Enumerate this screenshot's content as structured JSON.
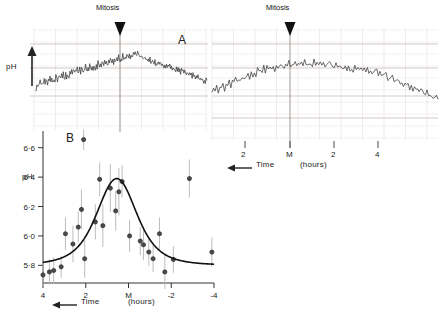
{
  "figure": {
    "title_a": "A",
    "title_b": "B",
    "mitosis_label_left": "Mitosis",
    "mitosis_label_right": "Mitosis",
    "ph_label_a": "pH",
    "ph_label_b": "pH",
    "time_label_a": "Time",
    "time_label_b": "Time",
    "hours_label_a": "(hours)",
    "hours_label_b": "(hours)",
    "ink_color": "#222222",
    "trace_color": "#3a3a3a",
    "grid_color": "#d8cfc8",
    "errorbar_color": "#b5b5b5"
  },
  "chart_data": [
    {
      "type": "line",
      "panel": "A",
      "title": "A",
      "description": "Continuous chart-recorder trace of intracellular pH through two successive mitoses",
      "ylabel": "pH",
      "xlabel": "Time",
      "xunits": "(hours)",
      "x_direction": "right-to-left",
      "annotations": [
        {
          "text": "Mitosis",
          "x_px": 120,
          "kind": "arrow-down"
        },
        {
          "text": "Mitosis",
          "x_px": 290,
          "kind": "arrow-down"
        }
      ],
      "grid": true,
      "axes": [
        {
          "id": "left-trace",
          "ticks": [],
          "tick_labels": []
        },
        {
          "id": "right-trace",
          "ticks": [
            245,
            290,
            334,
            378
          ],
          "tick_labels": [
            "2",
            "M",
            "2",
            "4"
          ]
        }
      ],
      "series": [
        {
          "name": "left-record",
          "values": [
            38,
            44,
            41,
            48,
            43,
            50,
            46,
            43,
            49,
            45,
            52,
            48,
            55,
            50,
            46,
            53,
            49,
            56,
            52,
            58,
            54,
            50,
            57,
            53,
            60,
            56,
            52,
            59,
            62,
            57,
            54,
            61,
            58,
            64,
            60,
            56,
            63,
            59,
            66,
            62,
            58,
            65,
            61,
            68,
            64,
            70,
            66,
            62,
            69,
            65,
            72,
            68,
            64,
            71,
            67,
            74,
            70,
            66,
            73,
            69,
            76,
            72,
            68,
            75,
            71,
            78,
            74,
            70,
            77,
            73,
            80,
            76,
            72,
            79,
            75,
            82,
            78,
            74,
            81,
            77,
            84,
            80,
            76,
            83,
            79,
            86,
            82,
            78,
            85,
            81,
            88,
            84,
            80,
            87,
            83,
            90,
            86,
            82,
            89,
            85,
            92,
            88,
            84,
            91,
            87,
            94,
            90,
            86,
            93,
            89,
            96,
            92,
            88,
            95,
            91,
            98,
            94,
            90,
            97,
            93,
            100,
            96,
            92,
            99,
            95,
            98,
            94,
            90,
            93,
            89,
            92,
            88,
            91,
            87,
            90,
            86,
            89,
            85,
            88,
            84,
            87,
            83,
            86,
            82,
            85,
            81,
            84,
            80,
            83,
            79,
            82,
            78,
            81,
            77,
            80,
            76,
            79,
            75,
            78,
            74,
            77,
            73,
            76,
            72,
            75,
            71,
            74,
            70,
            73,
            69,
            72,
            68,
            71,
            67,
            70,
            66,
            69,
            65,
            68,
            64,
            67,
            63,
            66,
            62,
            65,
            61,
            64,
            60,
            63,
            59,
            62,
            58,
            61,
            57,
            60,
            56,
            59,
            55,
            58,
            54,
            57,
            53,
            56,
            52,
            55,
            51,
            54,
            50
          ]
        },
        {
          "name": "right-record",
          "values": [
            44,
            50,
            46,
            53,
            48,
            55,
            50,
            57,
            52,
            59,
            54,
            61,
            56,
            63,
            58,
            65,
            60,
            67,
            62,
            69,
            64,
            71,
            66,
            73,
            68,
            75,
            70,
            77,
            72,
            79,
            74,
            81,
            76,
            83,
            78,
            85,
            80,
            87,
            82,
            84,
            80,
            86,
            82,
            88,
            84,
            86,
            82,
            88,
            84,
            90,
            86,
            88,
            84,
            90,
            86,
            92,
            88,
            90,
            86,
            92,
            88,
            90,
            86,
            92,
            88,
            94,
            90,
            92,
            88,
            90,
            86,
            88,
            84,
            90,
            86,
            88,
            84,
            86,
            82,
            88,
            84,
            86,
            82,
            84,
            80,
            86,
            82,
            84,
            80,
            82,
            78,
            84,
            80,
            82,
            78,
            80,
            76,
            82,
            78,
            80,
            76,
            78,
            74,
            80,
            76,
            78,
            74,
            76,
            72,
            74,
            70,
            72,
            68,
            70,
            66,
            68,
            64,
            66,
            62,
            64,
            60,
            62,
            58,
            60,
            56,
            58,
            54,
            56,
            52,
            54,
            50,
            52,
            48,
            50,
            46,
            48,
            44,
            46,
            42,
            44,
            40,
            42,
            38,
            40,
            36
          ]
        }
      ]
    },
    {
      "type": "scatter",
      "panel": "B",
      "title": "B",
      "description": "Mean intracellular pH versus time relative to mitosis with error bars and fitted curve",
      "ylabel": "pH",
      "xlabel": "Time",
      "xunits": "(hours)",
      "x_direction": "right-to-left",
      "ylim": [
        5.68,
        6.7
      ],
      "ytick_values": [
        6.6,
        6.4,
        6.2,
        6.0,
        5.8
      ],
      "ytick_labels": [
        "6·6",
        "6·4",
        "6·2",
        "6·0",
        "5·8"
      ],
      "xlim": [
        4,
        -4
      ],
      "xtick_values": [
        4,
        2,
        0,
        -2,
        -4
      ],
      "xtick_labels": [
        "4",
        "2",
        "M",
        "-2",
        "-4"
      ],
      "grid": false,
      "points": [
        {
          "x": 4.0,
          "y": 5.735,
          "err": 0.075
        },
        {
          "x": 3.7,
          "y": 5.755,
          "err": 0.085
        },
        {
          "x": 3.5,
          "y": 5.765,
          "err": 0.09
        },
        {
          "x": 3.15,
          "y": 5.79,
          "err": 0.075
        },
        {
          "x": 2.95,
          "y": 6.015,
          "err": 0.11
        },
        {
          "x": 2.6,
          "y": 5.945,
          "err": 0.125
        },
        {
          "x": 2.35,
          "y": 6.06,
          "err": 0.105
        },
        {
          "x": 2.2,
          "y": 6.18,
          "err": 0.135
        },
        {
          "x": 2.1,
          "y": 6.655,
          "err": 0.07
        },
        {
          "x": 2.05,
          "y": 5.845,
          "err": 0.13
        },
        {
          "x": 1.55,
          "y": 6.095,
          "err": 0.12
        },
        {
          "x": 1.35,
          "y": 6.385,
          "err": 0.115
        },
        {
          "x": 1.2,
          "y": 6.07,
          "err": 0.145
        },
        {
          "x": 0.85,
          "y": 6.325,
          "err": 0.165
        },
        {
          "x": 0.6,
          "y": 6.17,
          "err": 0.135
        },
        {
          "x": 0.45,
          "y": 6.3,
          "err": 0.16
        },
        {
          "x": 0.3,
          "y": 6.37,
          "err": 0.11
        },
        {
          "x": -0.05,
          "y": 6.0,
          "err": 0.11
        },
        {
          "x": -0.55,
          "y": 5.965,
          "err": 0.095
        },
        {
          "x": -0.7,
          "y": 5.94,
          "err": 0.105
        },
        {
          "x": -0.95,
          "y": 5.89,
          "err": 0.095
        },
        {
          "x": -1.15,
          "y": 5.845,
          "err": 0.09
        },
        {
          "x": -1.45,
          "y": 6.015,
          "err": 0.11
        },
        {
          "x": -1.7,
          "y": 5.755,
          "err": 0.115
        },
        {
          "x": -2.1,
          "y": 5.84,
          "err": 0.09
        },
        {
          "x": -2.85,
          "y": 6.39,
          "err": 0.13
        },
        {
          "x": -3.9,
          "y": 5.89,
          "err": 0.1
        }
      ],
      "fit_curve": {
        "name": "fitted-curve",
        "baseline": 5.8,
        "peak_y": 6.39,
        "peak_x": 0.55,
        "width": 1.25
      }
    }
  ]
}
